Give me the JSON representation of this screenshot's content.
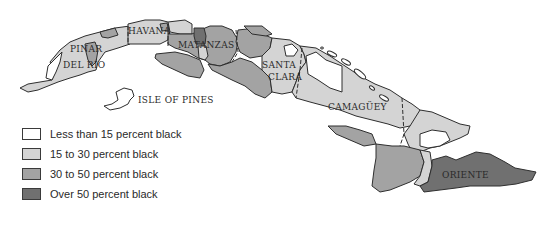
{
  "colors": {
    "under15": "#ffffff",
    "p15to30": "#d4d4d4",
    "p30to50": "#a3a3a3",
    "over50": "#707070",
    "outline": "#2e2e2e"
  },
  "provinces": [
    {
      "name": "PINAR",
      "line2": "DEL RÍO"
    },
    {
      "name": "HAVANA"
    },
    {
      "name": "MATANZAS"
    },
    {
      "name": "SANTA",
      "line2": "CLARA"
    },
    {
      "name": "CAMAGÜEY"
    },
    {
      "name": "ORIENTE"
    }
  ],
  "island_label": "ISLE OF PINES",
  "legend": [
    {
      "label": "Less than 15 percent black",
      "category": "under15"
    },
    {
      "label": "15 to 30 percent black",
      "category": "p15to30"
    },
    {
      "label": "30 to 50 percent black",
      "category": "p30to50"
    },
    {
      "label": "Over 50 percent black",
      "category": "over50"
    }
  ]
}
